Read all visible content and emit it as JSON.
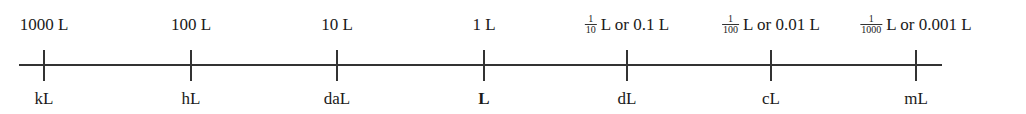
{
  "units": [
    {
      "x": 44,
      "top": {
        "plain": "1000 L"
      },
      "bottom": "kL",
      "bold": false
    },
    {
      "x": 191,
      "top": {
        "plain": "100 L"
      },
      "bottom": "hL",
      "bold": false
    },
    {
      "x": 337,
      "top": {
        "plain": "10 L"
      },
      "bottom": "daL",
      "bold": false
    },
    {
      "x": 484,
      "top": {
        "plain": "1 L"
      },
      "bottom": "L",
      "bold": true
    },
    {
      "x": 627,
      "top": {
        "num": "1",
        "den": "10",
        "rest": "L or 0.1 L"
      },
      "bottom": "dL",
      "bold": false
    },
    {
      "x": 771,
      "top": {
        "num": "1",
        "den": "100",
        "rest": "L or 0.01 L"
      },
      "bottom": "cL",
      "bold": false
    },
    {
      "x": 916,
      "top": {
        "num": "1",
        "den": "1000",
        "rest": "L or 0.001 L"
      },
      "bottom": "mL",
      "bold": false
    }
  ],
  "axis": {
    "x_start": 19,
    "x_end": 942,
    "y": 65
  }
}
